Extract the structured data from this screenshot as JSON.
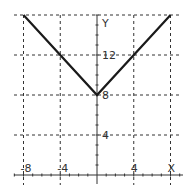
{
  "chart_data": {
    "type": "line",
    "title": "",
    "xlabel": "X",
    "ylabel": "Y",
    "xlim": [
      -8,
      8
    ],
    "ylim": [
      0,
      16
    ],
    "grid": true,
    "x_ticks": [
      -8,
      -4,
      4,
      8
    ],
    "x_tick_labels": [
      "-8",
      "-4",
      "4",
      "X"
    ],
    "y_ticks": [
      4,
      8,
      12,
      16
    ],
    "y_tick_labels": [
      "4",
      "8",
      "12",
      "Y"
    ],
    "series": [
      {
        "name": "y = |x| + 8",
        "x": [
          -8,
          0,
          8
        ],
        "y": [
          16,
          8,
          16
        ]
      }
    ]
  },
  "colors": {
    "line": "#1a1a1a",
    "grid": "#333333",
    "axis": "#333333",
    "background": "#ffffff"
  }
}
